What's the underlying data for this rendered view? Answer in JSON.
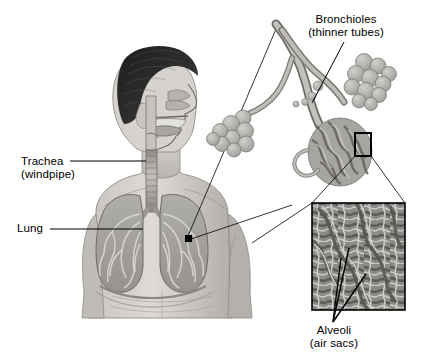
{
  "figure": {
    "background_color": "#ffffff",
    "line_color": "#000000",
    "text_color": "#000000"
  },
  "labels": {
    "trachea": {
      "line1": "Trachea",
      "line2": "(windpipe)"
    },
    "lung": {
      "line1": "Lung",
      "line2": ""
    },
    "bronchioles": {
      "line1": "Bronchioles",
      "line2": "(thinner tubes)"
    },
    "alveoli": {
      "line1": "Alveoli",
      "line2": "(air sacs)"
    }
  },
  "credit": {
    "text": ""
  },
  "palette": {
    "skin_light": "#d8d6d2",
    "skin_mid": "#bdbab5",
    "skin_shadow": "#9c9995",
    "hair_dark": "#2b2b2b",
    "lung_fill": "#a9a7a3",
    "lung_dark": "#8a8884",
    "airway": "#c9c7c3",
    "alveoli_cluster": "#b0aeaa",
    "micrograph_dark": "#6e6c68",
    "micrograph_light": "#c6c4c0"
  }
}
